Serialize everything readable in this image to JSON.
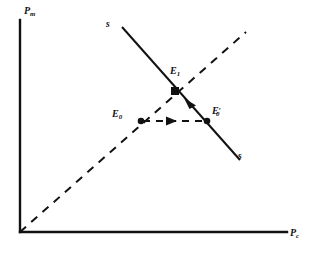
{
  "figure": {
    "type": "economics-diagram",
    "background_color": "#ffffff",
    "line_color": "#111111"
  },
  "axes": {
    "y_label_base": "P",
    "y_label_sub": "m",
    "x_label_base": "P",
    "x_label_sub": "c",
    "origin": {
      "x": 20,
      "y": 232
    },
    "x_axis_end": {
      "x": 287,
      "y": 232
    },
    "y_axis_end": {
      "x": 20,
      "y": 20
    }
  },
  "curves": {
    "supply": {
      "name": "ss",
      "label_top": "s",
      "label_bottom": "s",
      "style": "solid",
      "from": {
        "x": 122,
        "y": 27
      },
      "to": {
        "x": 240,
        "y": 160
      }
    },
    "forty_five_ray": {
      "name": "45-degree-ray",
      "style": "dashed",
      "from": {
        "x": 20,
        "y": 232
      },
      "to": {
        "x": 246,
        "y": 32
      }
    },
    "adjustment_path": {
      "name": "horizontal-adjustment",
      "style": "dashed",
      "from": {
        "x": 141,
        "y": 121
      },
      "to": {
        "x": 207,
        "y": 121
      },
      "arrow_direction": "right"
    },
    "supply_arrow": {
      "name": "supply-adjustment-arrow",
      "direction": "up-left",
      "at": {
        "x": 190,
        "y": 107
      }
    }
  },
  "points": [
    {
      "id": "E0",
      "base": "E",
      "sub": "0",
      "prime": "",
      "marker": "dot",
      "x": 141,
      "y": 121,
      "label_x": 113,
      "label_y": 113
    },
    {
      "id": "E0prime",
      "base": "E",
      "sub": "0",
      "prime": "′",
      "marker": "dot",
      "x": 207,
      "y": 121,
      "label_x": 212,
      "label_y": 111
    },
    {
      "id": "E1",
      "base": "E",
      "sub": "1",
      "prime": "",
      "marker": "square",
      "x": 175,
      "y": 91,
      "label_x": 171,
      "label_y": 70
    }
  ],
  "labels": {
    "supply_top": {
      "text": "s",
      "x": 106,
      "y": 23
    },
    "supply_bottom": {
      "text": "s",
      "x": 238,
      "y": 156
    },
    "y_axis": {
      "x": 24,
      "y": 8
    },
    "x_axis": {
      "x": 289,
      "y": 229
    }
  }
}
